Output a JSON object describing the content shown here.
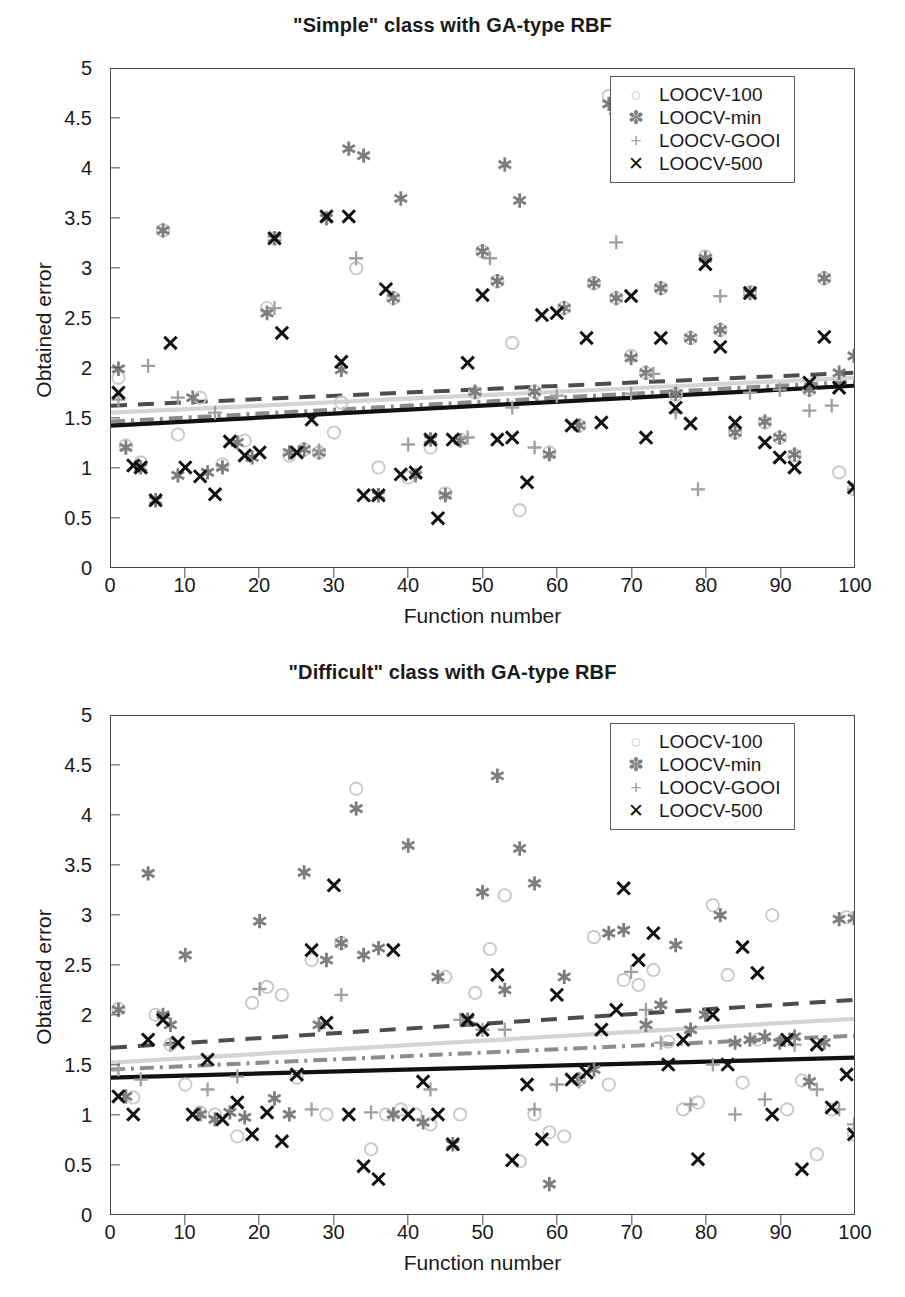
{
  "figures": [
    {
      "id": "simple",
      "title": "\"Simple\" class with GA-type RBF",
      "xlabel": "Function number",
      "ylabel": "Obtained error"
    },
    {
      "id": "difficult",
      "title": "\"Difficult\" class with GA-type RBF",
      "xlabel": "Function number",
      "ylabel": "Obtained error"
    }
  ],
  "axis": {
    "x_ticks": [
      "0",
      "10",
      "20",
      "30",
      "40",
      "50",
      "60",
      "70",
      "80",
      "90",
      "100"
    ],
    "y_ticks": [
      "0",
      "0.5",
      "1",
      "1.5",
      "2",
      "2.5",
      "3",
      "3.5",
      "4",
      "4.5",
      "5"
    ],
    "xlim": [
      0,
      100
    ],
    "ylim": [
      0,
      5
    ]
  },
  "legend": {
    "position": "top-right",
    "items": [
      {
        "glyph": "circle-marker-icon",
        "symbol": "○",
        "label": "LOOCV-100",
        "color": "#c9c9c9"
      },
      {
        "glyph": "asterisk-marker-icon",
        "symbol": "✽",
        "label": "LOOCV-min",
        "color": "#7d7d7d"
      },
      {
        "glyph": "plus-marker-icon",
        "symbol": "+",
        "label": "LOOCV-GOOI",
        "color": "#a0a0a0"
      },
      {
        "glyph": "cross-marker-icon",
        "symbol": "✕",
        "label": "LOOCV-500",
        "color": "#111111"
      }
    ]
  },
  "colors": {
    "loocv100": "#c9c9c9",
    "loocvmin": "#7d7d7d",
    "loocvgooi": "#a0a0a0",
    "loocv500": "#111111",
    "trend_dashed_dark": "#4d4d4d",
    "trend_solid_light": "#d4d4d4",
    "trend_dashdot_gray": "#8c8c8c",
    "trend_solid_black": "#111111",
    "axis": "#4a4a4a"
  },
  "chart_data": [
    {
      "type": "scatter",
      "title": "\"Simple\" class with GA-type RBF",
      "xlabel": "Function number",
      "ylabel": "Obtained error",
      "xlim": [
        0,
        100
      ],
      "ylim": [
        0,
        5
      ],
      "grid": false,
      "legend_position": "top right",
      "series": [
        {
          "name": "LOOCV-100",
          "marker": "o",
          "color": "#c9c9c9",
          "x": [
            1,
            2,
            4,
            7,
            9,
            12,
            15,
            18,
            21,
            22,
            24,
            26,
            28,
            30,
            31,
            33,
            35,
            36,
            38,
            40,
            43,
            45,
            47,
            49,
            50,
            52,
            54,
            55,
            57,
            59,
            61,
            63,
            65,
            67,
            68,
            70,
            72,
            74,
            76,
            78,
            80,
            82,
            84,
            86,
            88,
            90,
            92,
            94,
            96,
            98,
            100
          ],
          "y": [
            1.9,
            1.22,
            1.05,
            3.38,
            1.33,
            1.7,
            1.03,
            1.27,
            2.6,
            3.3,
            1.12,
            1.18,
            1.15,
            1.35,
            1.65,
            3.0,
            0.72,
            1.0,
            2.7,
            0.9,
            1.2,
            0.74,
            1.28,
            1.75,
            3.17,
            2.87,
            2.25,
            0.57,
            1.76,
            1.15,
            2.6,
            1.42,
            2.85,
            4.73,
            2.7,
            2.12,
            1.95,
            2.8,
            1.73,
            2.3,
            3.12,
            2.38,
            1.35,
            2.76,
            1.45,
            1.3,
            1.12,
            1.78,
            2.9,
            0.95,
            0.78
          ]
        },
        {
          "name": "LOOCV-min",
          "marker": "*",
          "color": "#7d7d7d",
          "x": [
            1,
            2,
            4,
            6,
            7,
            9,
            11,
            13,
            15,
            17,
            19,
            21,
            22,
            24,
            26,
            28,
            29,
            31,
            32,
            34,
            36,
            38,
            39,
            41,
            43,
            45,
            47,
            49,
            50,
            52,
            53,
            55,
            57,
            59,
            61,
            63,
            65,
            67,
            68,
            70,
            72,
            74,
            76,
            78,
            80,
            82,
            84,
            86,
            88,
            90,
            92,
            94,
            96,
            98,
            100
          ],
          "y": [
            1.99,
            1.2,
            1.0,
            0.67,
            3.38,
            0.92,
            1.7,
            0.95,
            1.0,
            1.25,
            1.1,
            2.55,
            3.3,
            1.15,
            1.18,
            1.15,
            3.5,
            1.98,
            4.2,
            4.13,
            0.72,
            2.7,
            3.7,
            0.92,
            1.28,
            0.72,
            1.27,
            1.76,
            3.17,
            2.87,
            4.04,
            3.68,
            1.76,
            1.13,
            2.6,
            1.42,
            2.85,
            4.65,
            2.7,
            2.1,
            1.95,
            2.8,
            1.74,
            2.3,
            3.1,
            2.38,
            1.35,
            2.75,
            1.46,
            1.3,
            1.13,
            1.78,
            2.9,
            1.95,
            2.12
          ]
        },
        {
          "name": "LOOCV-GOOI",
          "marker": "+",
          "color": "#a0a0a0",
          "x": [
            1,
            5,
            9,
            14,
            22,
            28,
            33,
            40,
            48,
            51,
            54,
            57,
            60,
            68,
            70,
            73,
            76,
            79,
            82,
            86,
            90,
            94,
            97,
            100
          ],
          "y": [
            1.68,
            2.02,
            1.7,
            1.55,
            2.6,
            1.17,
            3.1,
            1.23,
            1.3,
            3.1,
            1.6,
            1.2,
            1.72,
            3.26,
            1.74,
            1.94,
            1.55,
            0.78,
            2.72,
            1.75,
            1.78,
            1.57,
            1.62,
            0.78
          ]
        },
        {
          "name": "LOOCV-500",
          "marker": "x",
          "color": "#111111",
          "x": [
            1,
            3,
            4,
            6,
            8,
            10,
            12,
            14,
            16,
            18,
            20,
            22,
            23,
            25,
            27,
            29,
            31,
            32,
            34,
            36,
            37,
            39,
            41,
            43,
            44,
            46,
            48,
            50,
            52,
            54,
            56,
            58,
            60,
            62,
            64,
            66,
            68,
            70,
            72,
            74,
            76,
            78,
            80,
            82,
            84,
            86,
            88,
            90,
            92,
            94,
            96,
            98,
            100
          ],
          "y": [
            1.75,
            1.02,
            1.0,
            0.67,
            2.25,
            1.0,
            0.91,
            0.73,
            1.26,
            1.12,
            1.15,
            3.3,
            2.35,
            1.15,
            1.48,
            3.52,
            2.06,
            3.52,
            0.72,
            0.72,
            2.79,
            0.93,
            0.95,
            1.28,
            0.49,
            1.28,
            2.05,
            2.73,
            1.28,
            1.3,
            0.85,
            2.53,
            2.55,
            1.42,
            2.3,
            1.45,
            4.6,
            2.72,
            1.3,
            2.3,
            1.6,
            1.44,
            3.04,
            2.21,
            1.45,
            2.75,
            1.25,
            1.1,
            1.0,
            1.85,
            2.31,
            1.8,
            0.8
          ]
        }
      ],
      "trend_lines": [
        {
          "name": "LOOCV-min trend",
          "style": "dashed",
          "color": "#4d4d4d",
          "y_at_x0": 1.62,
          "y_at_x100": 1.95
        },
        {
          "name": "LOOCV-100 trend",
          "style": "solid",
          "color": "#d4d4d4",
          "y_at_x0": 1.55,
          "y_at_x100": 1.9
        },
        {
          "name": "LOOCV-GOOI trend",
          "style": "dashdot",
          "color": "#8c8c8c",
          "y_at_x0": 1.46,
          "y_at_x100": 1.86
        },
        {
          "name": "LOOCV-500 trend",
          "style": "solid",
          "color": "#111111",
          "y_at_x0": 1.42,
          "y_at_x100": 1.82
        }
      ]
    },
    {
      "type": "scatter",
      "title": "\"Difficult\" class with GA-type RBF",
      "xlabel": "Function number",
      "ylabel": "Obtained error",
      "xlim": [
        0,
        100
      ],
      "ylim": [
        0,
        5
      ],
      "grid": false,
      "legend_position": "top right",
      "series": [
        {
          "name": "LOOCV-100",
          "marker": "o",
          "color": "#c9c9c9",
          "x": [
            1,
            3,
            6,
            8,
            10,
            12,
            14,
            17,
            19,
            21,
            23,
            25,
            27,
            29,
            31,
            33,
            35,
            37,
            39,
            41,
            43,
            45,
            47,
            49,
            51,
            53,
            55,
            57,
            59,
            61,
            63,
            65,
            67,
            69,
            71,
            73,
            75,
            77,
            79,
            81,
            83,
            85,
            87,
            89,
            91,
            93,
            95,
            97,
            99,
            100
          ],
          "y": [
            2.06,
            1.17,
            2.0,
            1.7,
            1.3,
            1.02,
            1.0,
            0.78,
            2.12,
            2.28,
            2.2,
            1.37,
            2.55,
            1.0,
            2.72,
            4.27,
            0.65,
            1.0,
            1.05,
            1.0,
            0.9,
            2.38,
            1.0,
            2.22,
            2.66,
            3.2,
            0.53,
            1.0,
            0.82,
            0.78,
            1.35,
            2.78,
            1.3,
            2.35,
            2.3,
            2.45,
            1.73,
            1.05,
            1.12,
            3.1,
            2.4,
            1.32,
            1.75,
            3.0,
            1.05,
            1.34,
            0.6,
            1.05,
            2.98,
            0.8
          ]
        },
        {
          "name": "LOOCV-min",
          "marker": "*",
          "color": "#7d7d7d",
          "x": [
            1,
            2,
            5,
            7,
            8,
            10,
            12,
            14,
            16,
            18,
            20,
            22,
            24,
            26,
            28,
            29,
            31,
            33,
            34,
            36,
            38,
            40,
            42,
            44,
            46,
            48,
            50,
            52,
            53,
            55,
            57,
            59,
            61,
            63,
            65,
            67,
            69,
            70,
            72,
            74,
            76,
            78,
            80,
            82,
            84,
            86,
            88,
            90,
            92,
            94,
            96,
            98,
            100
          ],
          "y": [
            2.05,
            1.18,
            3.42,
            2.0,
            1.9,
            2.6,
            1.0,
            0.95,
            1.02,
            0.97,
            2.94,
            1.16,
            1.0,
            3.43,
            1.9,
            2.55,
            2.72,
            4.07,
            2.6,
            2.67,
            1.0,
            3.7,
            0.92,
            2.38,
            0.7,
            1.95,
            3.23,
            4.4,
            2.25,
            3.67,
            3.32,
            0.3,
            2.38,
            1.35,
            1.45,
            2.82,
            2.85,
            4.6,
            1.9,
            2.1,
            2.7,
            1.85,
            2.0,
            3.0,
            1.72,
            1.75,
            1.78,
            1.72,
            1.78,
            1.33,
            1.72,
            2.96,
            2.97
          ]
        },
        {
          "name": "LOOCV-GOOI",
          "marker": "+",
          "color": "#a0a0a0",
          "x": [
            1,
            4,
            8,
            13,
            17,
            20,
            27,
            31,
            35,
            43,
            47,
            50,
            53,
            57,
            60,
            63,
            70,
            72,
            74,
            78,
            81,
            84,
            88,
            92,
            95,
            98,
            100
          ],
          "y": [
            1.45,
            1.35,
            1.7,
            1.25,
            1.38,
            2.26,
            1.05,
            2.2,
            1.02,
            1.25,
            1.95,
            1.85,
            1.85,
            1.05,
            1.3,
            1.33,
            2.43,
            2.05,
            1.72,
            1.1,
            1.5,
            1.0,
            1.15,
            1.7,
            1.25,
            1.05,
            0.9
          ]
        },
        {
          "name": "LOOCV-500",
          "marker": "x",
          "color": "#111111",
          "x": [
            1,
            3,
            5,
            7,
            9,
            11,
            13,
            15,
            17,
            19,
            21,
            23,
            25,
            27,
            29,
            30,
            32,
            34,
            36,
            38,
            40,
            42,
            44,
            46,
            48,
            50,
            52,
            54,
            56,
            58,
            60,
            62,
            64,
            66,
            68,
            69,
            71,
            73,
            75,
            77,
            79,
            81,
            83,
            85,
            87,
            89,
            91,
            93,
            95,
            97,
            99,
            100
          ],
          "y": [
            1.18,
            1.0,
            1.75,
            1.95,
            1.72,
            1.0,
            1.55,
            0.95,
            1.12,
            0.8,
            1.02,
            0.73,
            1.4,
            2.65,
            1.92,
            3.3,
            1.0,
            0.48,
            0.35,
            2.65,
            1.0,
            1.33,
            1.0,
            0.7,
            1.95,
            1.85,
            2.4,
            0.54,
            1.3,
            0.75,
            2.2,
            1.35,
            1.42,
            1.85,
            2.05,
            3.27,
            2.55,
            2.82,
            1.5,
            1.75,
            0.55,
            2.0,
            1.5,
            2.68,
            2.42,
            1.0,
            1.75,
            0.45,
            1.7,
            1.07,
            1.4,
            0.8
          ]
        }
      ],
      "trend_lines": [
        {
          "name": "LOOCV-min trend",
          "style": "dashed",
          "color": "#4d4d4d",
          "y_at_x0": 1.67,
          "y_at_x100": 2.15
        },
        {
          "name": "LOOCV-100 trend",
          "style": "solid",
          "color": "#d4d4d4",
          "y_at_x0": 1.52,
          "y_at_x100": 1.96
        },
        {
          "name": "LOOCV-GOOI trend",
          "style": "dashdot",
          "color": "#8c8c8c",
          "y_at_x0": 1.45,
          "y_at_x100": 1.79
        },
        {
          "name": "LOOCV-500 trend",
          "style": "solid",
          "color": "#111111",
          "y_at_x0": 1.37,
          "y_at_x100": 1.57
        }
      ]
    }
  ]
}
